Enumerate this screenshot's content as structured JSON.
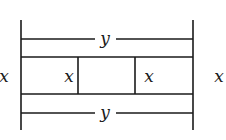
{
  "diagram": {
    "labels": {
      "top_span": "y",
      "bottom_span": "y",
      "outer_left": "x",
      "outer_right": "x",
      "inner_left": "x",
      "inner_right": "x"
    },
    "line_color": "#1a1a1a",
    "background": "#ffffff"
  }
}
